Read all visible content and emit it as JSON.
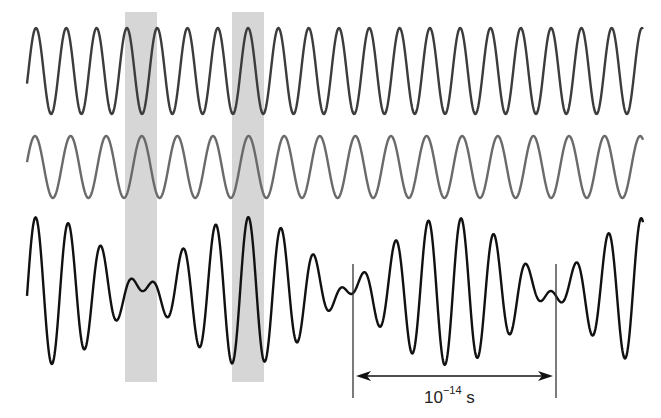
{
  "figure": {
    "colors": {
      "background": "#ffffff",
      "band": "#d6d6d6",
      "wave_top": "#3c3c3c",
      "wave_middle": "#6a6a6a",
      "wave_sum": "#111111",
      "marker": "#333333"
    },
    "x_start": 27,
    "x_end": 643,
    "bands": [
      {
        "x": 125,
        "width": 32,
        "y": 12,
        "height": 370
      },
      {
        "x": 232,
        "width": 32,
        "y": 12,
        "height": 370
      }
    ],
    "waves": [
      {
        "name": "wave-top",
        "center_y": 71,
        "amplitude": 43,
        "period": 30.3,
        "phase_peak_x": 36,
        "stroke": 2.4
      },
      {
        "name": "wave-middle",
        "center_y": 167,
        "amplitude": 31,
        "period": 35.6,
        "phase_peak_x": 35,
        "stroke": 2.4
      }
    ],
    "sum_wave": {
      "name": "wave-sum",
      "center_y": 291,
      "amplitude_each": 37,
      "stroke": 2.4
    },
    "markers": [
      {
        "x": 353,
        "y1": 264,
        "y2": 398
      },
      {
        "x": 556,
        "y1": 264,
        "y2": 398
      }
    ],
    "arrow": {
      "x1": 356,
      "x2": 553,
      "y": 376
    },
    "label": {
      "base": "10",
      "exponent": "−14",
      "unit": " s",
      "x": 424,
      "y": 386
    }
  }
}
